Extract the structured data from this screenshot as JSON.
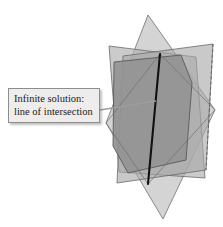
{
  "figure": {
    "background_color": "#ffffff",
    "width": 223,
    "height": 227
  },
  "callout": {
    "line1": "Infinite solution:",
    "line2": "line of intersection",
    "box_fill": "#eeedec",
    "box_border": "#8d8d8d",
    "text_color": "#1a1a1a",
    "leader_color": "#9a9a9a"
  },
  "geometry": {
    "intersection_line": {
      "name": "line-of-intersection",
      "color": "#101010",
      "x1": 160,
      "y1": 54,
      "x2": 148,
      "y2": 184
    },
    "planes": [
      {
        "name": "plane-back-tilted",
        "fill": "#b9b9b9",
        "opacity": 0.75,
        "stroke": "#6f6f6f",
        "points": "148,15 215,110 163,219 106,123"
      },
      {
        "name": "plane-left-quad",
        "fill": "#b4b4b4",
        "opacity": 0.7,
        "stroke": "#6a6a6a",
        "points": "109,46 196,57 205,178 119,172"
      },
      {
        "name": "plane-right-quad",
        "fill": "#ababab",
        "opacity": 0.7,
        "stroke": "#6a6a6a",
        "points": "123,56 213,44 206,170 117,183"
      },
      {
        "name": "plane-front-shaded",
        "fill": "#949494",
        "opacity": 0.95,
        "stroke": "#5a5a5a",
        "points": "114,62 181,55 192,83 186,160 128,173 113,146"
      }
    ]
  }
}
